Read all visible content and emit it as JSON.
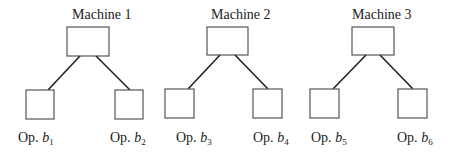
{
  "diagram": {
    "machines": [
      {
        "label": "Machine 1",
        "ops": [
          {
            "prefix": "Op. ",
            "var": "b",
            "sub": "1"
          },
          {
            "prefix": "Op. ",
            "var": "b",
            "sub": "2"
          }
        ]
      },
      {
        "label": "Machine 2",
        "ops": [
          {
            "prefix": "Op. ",
            "var": "b",
            "sub": "3"
          },
          {
            "prefix": "Op. ",
            "var": "b",
            "sub": "4"
          }
        ]
      },
      {
        "label": "Machine 3",
        "ops": [
          {
            "prefix": "Op. ",
            "var": "b",
            "sub": "5"
          },
          {
            "prefix": "Op. ",
            "var": "b",
            "sub": "6"
          }
        ]
      }
    ]
  }
}
